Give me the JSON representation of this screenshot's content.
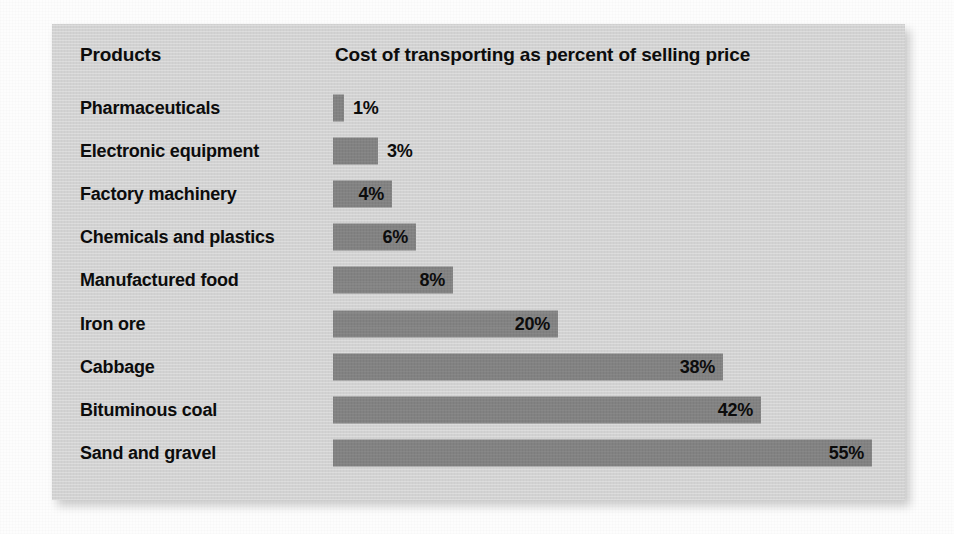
{
  "chart_data": {
    "type": "bar",
    "orientation": "horizontal",
    "title": "Cost of transporting as percent of selling price",
    "xlabel": "",
    "ylabel": "Products",
    "categories": [
      "Pharmaceuticals",
      "Electronic equipment",
      "Factory machinery",
      "Chemicals and plastics",
      "Manufactured food",
      "Iron ore",
      "Cabbage",
      "Bituminous coal",
      "Sand and gravel"
    ],
    "values": [
      1,
      3,
      4,
      6,
      8,
      20,
      38,
      42,
      55
    ],
    "value_labels": [
      "1%",
      "3%",
      "4%",
      "6%",
      "8%",
      "20%",
      "38%",
      "42%",
      "55%"
    ],
    "unit": "%",
    "xlim": [
      0,
      55
    ],
    "grid": false,
    "legend": "none",
    "bar_color": "#828282",
    "panel_color": "#d2d2d2",
    "text_color": "#0c0c0c"
  },
  "columns": {
    "category_header": "Products",
    "value_header": "Cost of transporting as percent of selling price"
  },
  "rows": [
    {
      "label": "Pharmaceuticals",
      "value": 1,
      "display": "1%",
      "bar_px": 11,
      "label_outside": true
    },
    {
      "label": "Electronic equipment",
      "value": 3,
      "display": "3%",
      "bar_px": 45,
      "label_outside": true
    },
    {
      "label": "Factory machinery",
      "value": 4,
      "display": "4%",
      "bar_px": 59,
      "label_outside": false
    },
    {
      "label": "Chemicals and plastics",
      "value": 6,
      "display": "6%",
      "bar_px": 83,
      "label_outside": false
    },
    {
      "label": "Manufactured food",
      "value": 8,
      "display": "8%",
      "bar_px": 120,
      "label_outside": false
    },
    {
      "label": "Iron ore",
      "value": 20,
      "display": "20%",
      "bar_px": 225,
      "label_outside": false
    },
    {
      "label": "Cabbage",
      "value": 38,
      "display": "38%",
      "bar_px": 390,
      "label_outside": false
    },
    {
      "label": "Bituminous coal",
      "value": 42,
      "display": "42%",
      "bar_px": 428,
      "label_outside": false
    },
    {
      "label": "Sand and gravel",
      "value": 55,
      "display": "55%",
      "bar_px": 539,
      "label_outside": false
    }
  ]
}
